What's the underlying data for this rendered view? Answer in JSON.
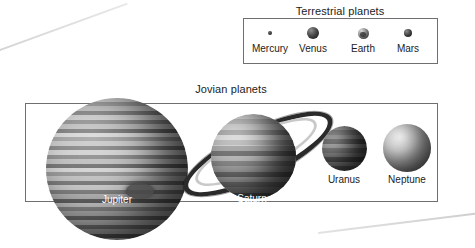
{
  "figure": {
    "background_color": "#ffffff",
    "frame_color": "#6f6f6f"
  },
  "sections": {
    "terrestrial": {
      "title": "Terrestrial planets",
      "planets": [
        {
          "name": "Mercury",
          "icon": "mercury-planet-icon"
        },
        {
          "name": "Venus",
          "icon": "venus-planet-icon"
        },
        {
          "name": "Earth",
          "icon": "earth-planet-icon"
        },
        {
          "name": "Mars",
          "icon": "mars-planet-icon"
        }
      ]
    },
    "jovian": {
      "title": "Jovian planets",
      "planets": [
        {
          "name": "Jupiter",
          "icon": "jupiter-planet-icon"
        },
        {
          "name": "Saturn",
          "icon": "saturn-planet-icon"
        },
        {
          "name": "Uranus",
          "icon": "uranus-planet-icon"
        },
        {
          "name": "Neptune",
          "icon": "neptune-planet-icon"
        }
      ]
    }
  }
}
